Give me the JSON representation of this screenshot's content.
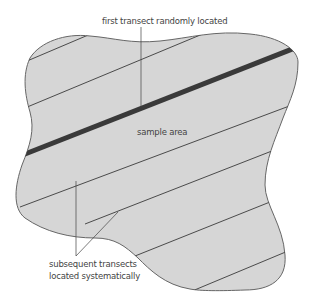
{
  "diagram": {
    "title_cut_off": "",
    "labels": {
      "first_transect": "first transect randomly located",
      "sample_area": "sample area",
      "subsequent_line1": "subsequent transects",
      "subsequent_line2": "located systematically"
    },
    "colors": {
      "area_fill": "#d6d6d6",
      "outline": "#666666",
      "transect_line": "#3a3a3a",
      "first_transect": "#3a3a3a",
      "text": "#444444"
    },
    "shapes": {
      "sample_area": "irregular closed polygon outline filled grey",
      "first_transect": "thick dark diagonal line",
      "subsequent_transects_count": 6
    }
  }
}
